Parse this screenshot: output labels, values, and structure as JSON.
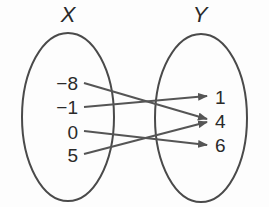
{
  "diagram": {
    "type": "mapping",
    "domain_set": {
      "name": "X",
      "elements": [
        "−8",
        "−1",
        "0",
        "5"
      ]
    },
    "range_set": {
      "name": "Y",
      "elements": [
        "1",
        "4",
        "6"
      ]
    },
    "mappings": [
      {
        "from": "−8",
        "to": "4"
      },
      {
        "from": "−1",
        "to": "1"
      },
      {
        "from": "0",
        "to": "6"
      },
      {
        "from": "5",
        "to": "4"
      }
    ],
    "colors": {
      "stroke": "#4a4a4a",
      "text": "#2a2a2a",
      "arrow": "#555555"
    }
  }
}
